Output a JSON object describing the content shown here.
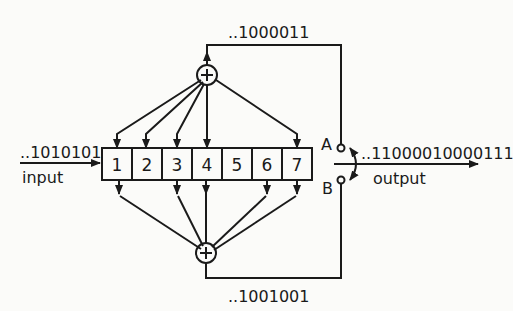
{
  "diagram": {
    "type": "convolutional-encoder",
    "input": {
      "bits": "..1010101",
      "label": "input"
    },
    "output": {
      "bits": "..11000010000111",
      "label": "output"
    },
    "register": {
      "cells": [
        "1",
        "2",
        "3",
        "4",
        "5",
        "6",
        "7"
      ]
    },
    "top_adder": {
      "symbol": "+",
      "taps": [
        1,
        2,
        3,
        4,
        7
      ],
      "sequence": "..1000011"
    },
    "bottom_adder": {
      "symbol": "+",
      "taps": [
        1,
        3,
        4,
        6,
        7
      ],
      "sequence": "..1001001"
    },
    "switch": {
      "terminal_a": "A",
      "terminal_b": "B"
    }
  }
}
